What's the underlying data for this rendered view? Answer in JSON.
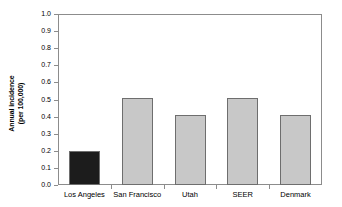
{
  "chart_data": {
    "type": "bar",
    "title": "",
    "subtitle": "",
    "xlabel": "",
    "ylabel": "Annual incidence\n(per 100,000)",
    "ylabel_line1": "Annual incidence",
    "ylabel_line2": "(per 100,000)",
    "categories": [
      "Los Angeles",
      "San Francisco",
      "Utah",
      "SEER",
      "Denmark"
    ],
    "values": [
      0.2,
      0.51,
      0.41,
      0.51,
      0.41
    ],
    "bar_colors": [
      "#1c1c1c",
      "#c8c8c8",
      "#c8c8c8",
      "#c8c8c8",
      "#c8c8c8"
    ],
    "ylim": [
      0.0,
      1.0
    ],
    "ytick_values": [
      0.0,
      0.1,
      0.2,
      0.3,
      0.4,
      0.5,
      0.6,
      0.7,
      0.8,
      0.9,
      1.0
    ],
    "ytick_labels": [
      "0.0",
      "0.1",
      "0.2",
      "0.3",
      "0.4",
      "0.5",
      "0.6",
      "0.7",
      "0.8",
      "0.9",
      "1.0"
    ],
    "grid": false,
    "legend": null,
    "legend_position": "none",
    "annotations": [],
    "frame_color": "#8c8c8c",
    "bar_edge_color": "#6e6e6e",
    "highlight_color": "#1c1c1c",
    "default_bar_color": "#c8c8c8"
  }
}
